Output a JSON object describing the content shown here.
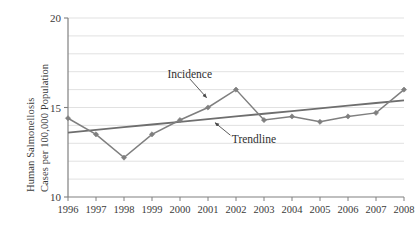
{
  "chart_data": {
    "type": "line",
    "title": "",
    "xlabel": "",
    "ylabel": "Human Salmonellosis Cases per 100,000 Population",
    "ylabel_lines": [
      "Human Salmonellosis",
      "Cases per 100,000 Population"
    ],
    "categories": [
      1996,
      1997,
      1998,
      1999,
      2000,
      2001,
      2002,
      2003,
      2004,
      2005,
      2006,
      2007,
      2008
    ],
    "x_tick_labels": [
      "1996",
      "1997",
      "1998",
      "1999",
      "2000",
      "2001",
      "2002",
      "2003",
      "2004",
      "2005",
      "2006",
      "2007",
      "2008"
    ],
    "y_tick_labels": [
      "10",
      "15",
      "20"
    ],
    "y_ticks": [
      10,
      15,
      20
    ],
    "ylim": [
      10,
      20
    ],
    "xlim": [
      1996,
      2008
    ],
    "grid": true,
    "grid_interval": 1,
    "gridlines": [
      11,
      12,
      13,
      14,
      15,
      16,
      17,
      18,
      19,
      20
    ],
    "legend": "none",
    "series": [
      {
        "name": "Incidence",
        "marker": "diamond",
        "color": "#7f7f7f",
        "values": [
          14.4,
          13.5,
          12.2,
          13.5,
          14.3,
          15.0,
          16.0,
          14.3,
          14.5,
          14.2,
          14.5,
          14.7,
          16.0
        ]
      },
      {
        "name": "Trendline",
        "marker": "none",
        "color": "#6e6e6e",
        "values": [
          13.6,
          13.75,
          13.9,
          14.05,
          14.2,
          14.35,
          14.5,
          14.65,
          14.8,
          14.95,
          15.1,
          15.25,
          15.4
        ]
      }
    ],
    "annotations": [
      {
        "label": "Incidence",
        "text_x": 1999.55,
        "text_y": 16.85,
        "arrow_from_x": 2000.35,
        "arrow_from_y": 16.6,
        "arrow_to_x": 2000.95,
        "arrow_to_y": 15.55
      },
      {
        "label": "Trendline",
        "text_x": 2001.85,
        "text_y": 13.25,
        "arrow_from_x": 2001.8,
        "arrow_from_y": 13.45,
        "arrow_to_x": 2001.25,
        "arrow_to_y": 14.15
      }
    ],
    "colors": {
      "incidence": "#7f7f7f",
      "trendline": "#6e6e6e",
      "grid": "#d9d9d9",
      "axis": "#808080",
      "text": "#3a3a3a",
      "background": "#ffffff"
    }
  }
}
